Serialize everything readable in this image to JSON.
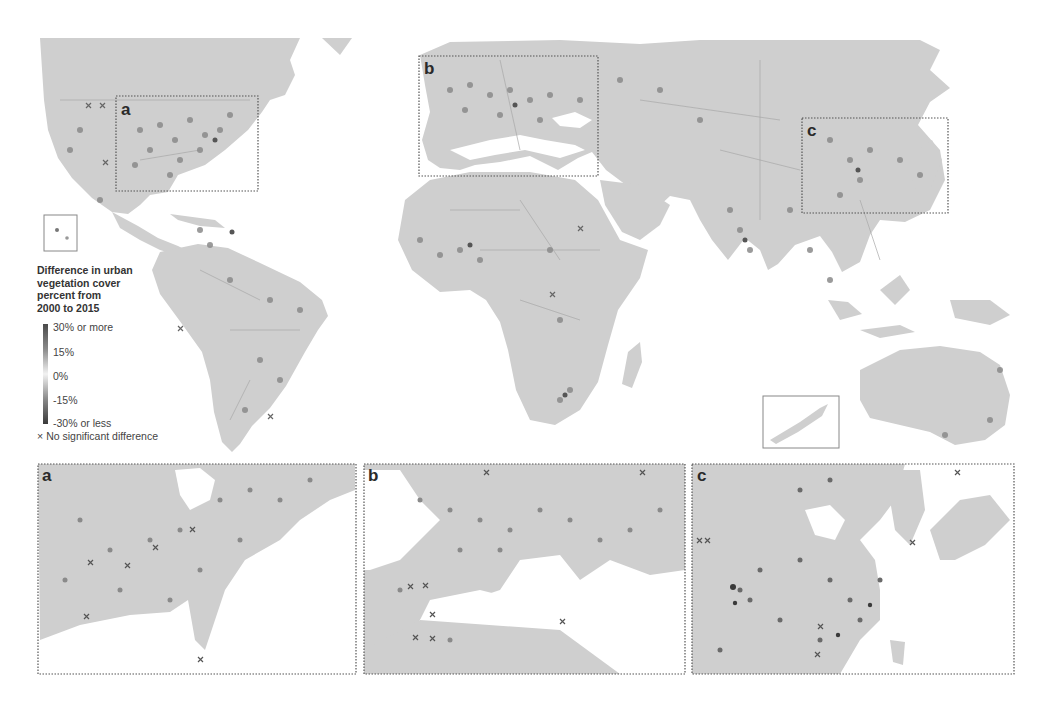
{
  "figure": {
    "title": "Difference in urban vegetation cover percent from 2000 to 2015",
    "main_map": {
      "inset_labels": [
        "a",
        "b",
        "c"
      ],
      "inset_regions": [
        {
          "label": "a",
          "region": "Eastern United States"
        },
        {
          "label": "b",
          "region": "Europe and Mediterranean"
        },
        {
          "label": "c",
          "region": "Eastern China, Korea and Japan"
        }
      ],
      "small_insets": [
        "Hawaii",
        "New Zealand"
      ]
    },
    "legend": {
      "title_lines": [
        "Difference in urban",
        "vegetation cover",
        "percent from",
        "2000 to 2015"
      ],
      "ticks": [
        "30% or more",
        "15%",
        "0%",
        "-15%",
        "-30% or less"
      ],
      "no_sig_symbol": "×",
      "no_sig_label": "No significant difference",
      "colors": {
        "high": "#4a4a4a",
        "mid": "#f2f2f2",
        "low": "#3a3a3a",
        "land": "#cfcfcf",
        "water": "#ffffff"
      }
    },
    "panels": [
      {
        "label": "a",
        "region": "Eastern United States"
      },
      {
        "label": "b",
        "region": "Europe and Mediterranean"
      },
      {
        "label": "c",
        "region": "Eastern China, Korea and Japan"
      }
    ]
  }
}
